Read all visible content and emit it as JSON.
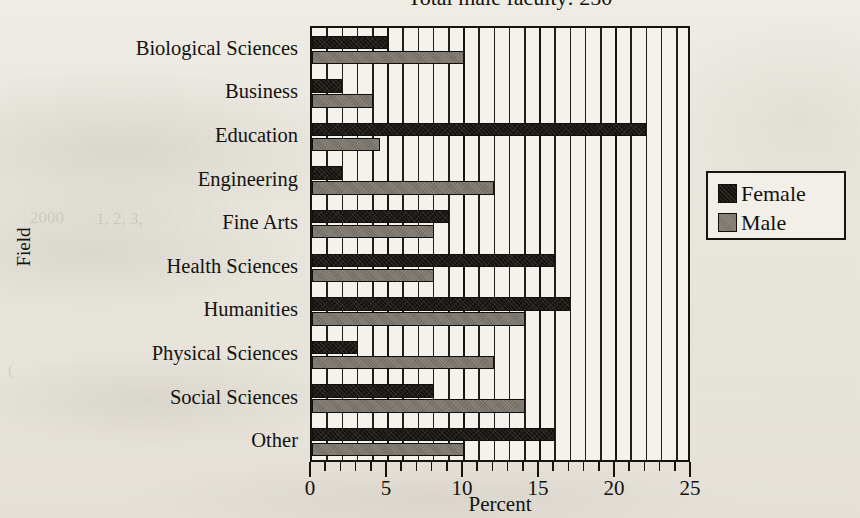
{
  "chart_data": {
    "type": "bar",
    "orientation": "horizontal",
    "title": "Total male faculty:  250",
    "xlabel": "Percent",
    "ylabel": "Field",
    "xlim": [
      0,
      25
    ],
    "xticks": [
      0,
      5,
      10,
      15,
      20,
      25
    ],
    "xtick_labels": [
      "0",
      "5",
      "10",
      "15",
      "20",
      "25"
    ],
    "minor_tick_interval": 1,
    "grid": true,
    "grid_axis": "x",
    "legend_position": "right",
    "categories": [
      "Biological Sciences",
      "Business",
      "Education",
      "Engineering",
      "Fine Arts",
      "Health Sciences",
      "Humanities",
      "Physical Sciences",
      "Social Sciences",
      "Other"
    ],
    "series": [
      {
        "name": "Female",
        "color": "#171410",
        "values": [
          5,
          2,
          22,
          2,
          9,
          16,
          17,
          3,
          8,
          16
        ]
      },
      {
        "name": "Male",
        "color": "#787268",
        "values": [
          10,
          4,
          4.5,
          12,
          8,
          8,
          14,
          12,
          14,
          10
        ]
      }
    ]
  },
  "legend": {
    "items": [
      {
        "label": "Female",
        "swatch": "female"
      },
      {
        "label": "Male",
        "swatch": "male"
      }
    ]
  },
  "ghosts": [
    {
      "text": "2000",
      "x": 30,
      "y": 208
    },
    {
      "text": "1, 2, 3,",
      "x": 96,
      "y": 209
    },
    {
      "text": "(",
      "x": 8,
      "y": 360
    }
  ]
}
